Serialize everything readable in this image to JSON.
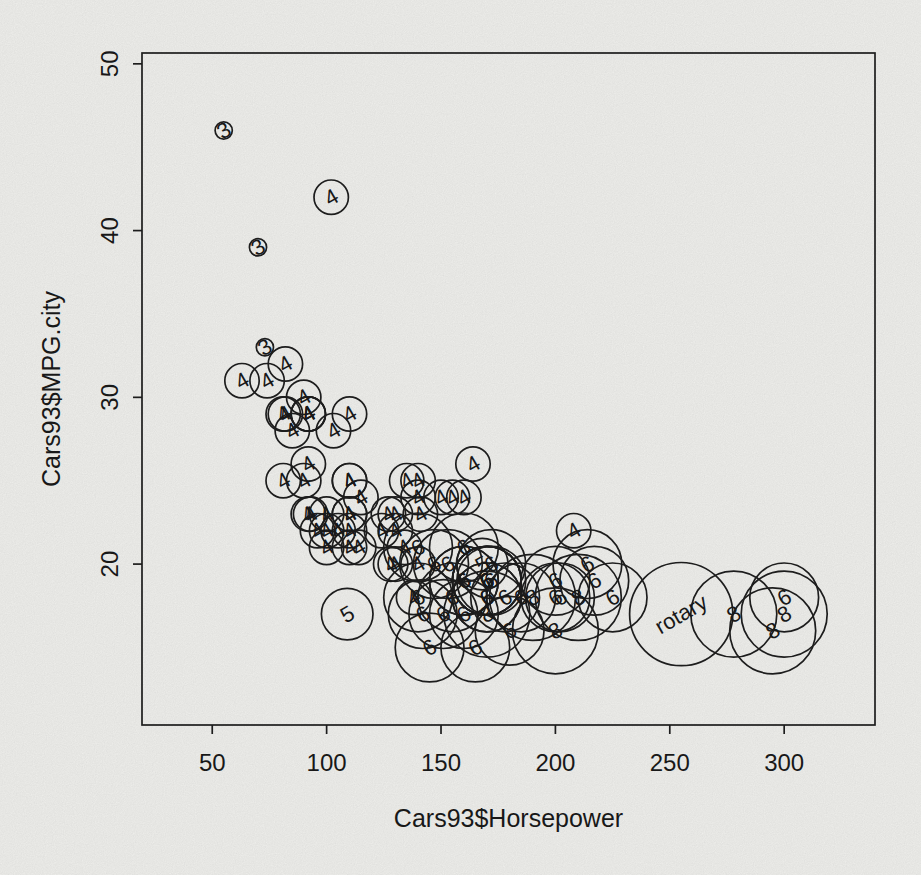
{
  "figure": {
    "background_color": "#f4f4f1",
    "ink_color": "#1f1f1f"
  },
  "chart_data": {
    "type": "scatter",
    "title": "",
    "xlabel": "Cars93$Horsepower",
    "ylabel": "Cars93$MPG.city",
    "x_ticks": [
      50,
      100,
      150,
      200,
      250,
      300
    ],
    "y_ticks": [
      20,
      30,
      40,
      50
    ],
    "xlim": [
      19.3,
      339.7
    ],
    "ylim": [
      10.35,
      50.65
    ],
    "grid": false,
    "legend_position": "none",
    "label_rotation_deg": -30,
    "size_encoding_note": "circle radius (px) encodes Cars93$Cylinders level",
    "size_encoding": {
      "3": 8.6,
      "4": 17.2,
      "5": 25.8,
      "6": 34.4,
      "8": 43,
      "rotary": 51.6
    },
    "n_points": 93,
    "points_fields": [
      "horsepower",
      "mpg_city",
      "cylinders"
    ],
    "points": [
      [
        140,
        25,
        "4"
      ],
      [
        200,
        18,
        "6"
      ],
      [
        172,
        20,
        "6"
      ],
      [
        172,
        19,
        "6"
      ],
      [
        208,
        22,
        "4"
      ],
      [
        110,
        22,
        "4"
      ],
      [
        170,
        19,
        "6"
      ],
      [
        180,
        16,
        "6"
      ],
      [
        170,
        19,
        "6"
      ],
      [
        200,
        16,
        "8"
      ],
      [
        295,
        16,
        "8"
      ],
      [
        110,
        25,
        "4"
      ],
      [
        110,
        25,
        "4"
      ],
      [
        160,
        19,
        "6"
      ],
      [
        110,
        21,
        "4"
      ],
      [
        170,
        18,
        "6"
      ],
      [
        165,
        15,
        "6"
      ],
      [
        170,
        17,
        "8"
      ],
      [
        300,
        17,
        "8"
      ],
      [
        153,
        20,
        "6"
      ],
      [
        141,
        23,
        "4"
      ],
      [
        147,
        20,
        "6"
      ],
      [
        92,
        29,
        "4"
      ],
      [
        93,
        23,
        "4"
      ],
      [
        100,
        22,
        "4"
      ],
      [
        142,
        17,
        "6"
      ],
      [
        100,
        21,
        "4"
      ],
      [
        300,
        18,
        "6"
      ],
      [
        92,
        29,
        "4"
      ],
      [
        214,
        20,
        "6"
      ],
      [
        63,
        31,
        "4"
      ],
      [
        127,
        23,
        "4"
      ],
      [
        96,
        22,
        "4"
      ],
      [
        105,
        22,
        "4"
      ],
      [
        115,
        24,
        "4"
      ],
      [
        145,
        15,
        "6"
      ],
      [
        140,
        21,
        "6"
      ],
      [
        190,
        18,
        "8"
      ],
      [
        55,
        46,
        "3"
      ],
      [
        90,
        30,
        "4"
      ],
      [
        160,
        24,
        "4"
      ],
      [
        102,
        42,
        "4"
      ],
      [
        140,
        24,
        "4"
      ],
      [
        81,
        29,
        "4"
      ],
      [
        124,
        22,
        "4"
      ],
      [
        92,
        26,
        "4"
      ],
      [
        128,
        20,
        "4"
      ],
      [
        278,
        17,
        "8"
      ],
      [
        185,
        18,
        "6"
      ],
      [
        225,
        18,
        "6"
      ],
      [
        160,
        17,
        "6"
      ],
      [
        210,
        18,
        "8"
      ],
      [
        82,
        29,
        "4"
      ],
      [
        103,
        28,
        "4"
      ],
      [
        164,
        26,
        "4"
      ],
      [
        155,
        18,
        "6"
      ],
      [
        255,
        17,
        "rotary"
      ],
      [
        130,
        20,
        "4"
      ],
      [
        217,
        19,
        "6"
      ],
      [
        100,
        23,
        "4"
      ],
      [
        140,
        18,
        "6"
      ],
      [
        92,
        29,
        "4"
      ],
      [
        202,
        18,
        "6"
      ],
      [
        110,
        29,
        "4"
      ],
      [
        150,
        24,
        "4"
      ],
      [
        151,
        17,
        "6"
      ],
      [
        160,
        21,
        "6"
      ],
      [
        155,
        24,
        "4"
      ],
      [
        110,
        23,
        "4"
      ],
      [
        170,
        18,
        "6"
      ],
      [
        170,
        19,
        "6"
      ],
      [
        92,
        23,
        "4"
      ],
      [
        74,
        31,
        "4"
      ],
      [
        110,
        23,
        "4"
      ],
      [
        160,
        19,
        "6"
      ],
      [
        200,
        19,
        "6"
      ],
      [
        170,
        19,
        "6"
      ],
      [
        140,
        20,
        "4"
      ],
      [
        85,
        28,
        "4"
      ],
      [
        73,
        33,
        "3"
      ],
      [
        90,
        25,
        "4"
      ],
      [
        130,
        23,
        "4"
      ],
      [
        70,
        39,
        "3"
      ],
      [
        82,
        32,
        "4"
      ],
      [
        135,
        25,
        "4"
      ],
      [
        130,
        22,
        "4"
      ],
      [
        138,
        18,
        "4"
      ],
      [
        81,
        25,
        "4"
      ],
      [
        109,
        17,
        "5"
      ],
      [
        134,
        21,
        "4"
      ],
      [
        178,
        18,
        "6"
      ],
      [
        114,
        21,
        "4"
      ],
      [
        168,
        20,
        "5"
      ]
    ]
  }
}
